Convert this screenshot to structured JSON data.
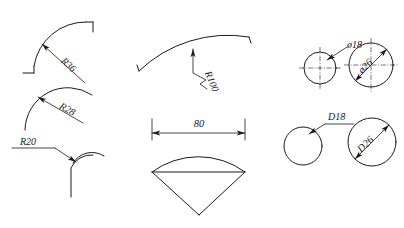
{
  "drawing": {
    "title": "Radius and diameter dimensioning examples",
    "background_color": "#ffffff",
    "line_color": "#1a1a1a",
    "figures": [
      {
        "id": "arc-r36",
        "type": "arc-with-radius-dimension",
        "label": "R36",
        "label_rotation_deg": 45,
        "description": "Quarter arc with tangent stubs at both ends, radius leader with arrowhead pointing at arc"
      },
      {
        "id": "arc-r28",
        "type": "arc-with-radius-dimension",
        "label": "R28",
        "label_rotation_deg": 40,
        "description": "Open arc with radius leader arrow pointing at arc from interior"
      },
      {
        "id": "arc-r20",
        "type": "arc-with-radius-dimension",
        "label": "R20",
        "label_rotation_deg": 0,
        "description": "Concave fillet junction with horizontal leader shoulder and arrow"
      },
      {
        "id": "arc-r100",
        "type": "arc-with-radius-dimension",
        "label": "R100",
        "label_rotation_deg": 70,
        "description": "Shallow large-radius arc with jogged (zigzag) radius leader"
      },
      {
        "id": "width-80",
        "type": "linear-dimension",
        "label": "80",
        "label_rotation_deg": 0,
        "description": "Horizontal dimension line with extension lines and arrowheads above cone figure"
      },
      {
        "id": "cone-figure",
        "type": "outline",
        "label": "",
        "description": "Fan/cone outline: top arc, horizontal chord, two sloped sides meeting at bottom point"
      },
      {
        "id": "circle-phi18",
        "type": "circle-with-diameter-leader",
        "label": "ø18",
        "label_rotation_deg": 0,
        "description": "Small circle with center marks and external diameter leader"
      },
      {
        "id": "circle-phi26",
        "type": "circle-with-diameter-dimension",
        "label": "ø26",
        "label_rotation_deg": -40,
        "description": "Circle with center marks and internal diagonal diameter dimension, arrows at both ends"
      },
      {
        "id": "circle-d18",
        "type": "circle-with-diameter-leader",
        "label": "D18",
        "label_rotation_deg": 0,
        "description": "Plain circle with leader line and shoulder underline carrying the label"
      },
      {
        "id": "circle-d26",
        "type": "circle-with-diameter-dimension",
        "label": "D26",
        "label_rotation_deg": -40,
        "description": "Circle with internal diagonal diameter dimension line and arrows at both ends"
      }
    ]
  }
}
